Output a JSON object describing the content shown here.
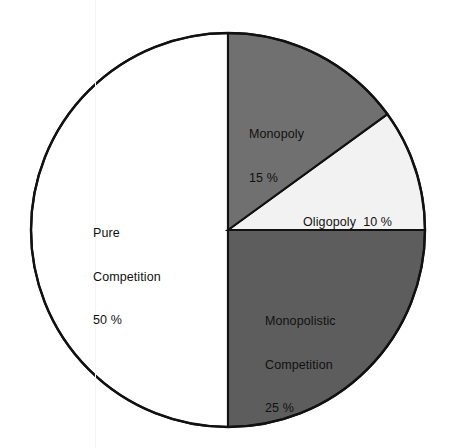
{
  "chart_data": {
    "type": "pie",
    "title": "",
    "subtitle": "",
    "xlabel": "",
    "ylabel": "",
    "legend": "none",
    "grid": false,
    "start_angle_deg": 0,
    "direction": "clockwise",
    "categories": [
      "Monopoly",
      "Oligopoly",
      "Monopolistic Competition",
      "Pure Competition"
    ],
    "values": [
      15,
      10,
      25,
      50
    ],
    "value_unit": "%",
    "slices": [
      {
        "name": "Monopoly",
        "label_lines": [
          "Monopoly",
          "15 %"
        ],
        "value": 15,
        "value_text": "15 %",
        "color": "#707070",
        "start_deg": 0,
        "end_deg": 54
      },
      {
        "name": "Oligopoly",
        "label_lines": [
          "Oligopoly  10 %"
        ],
        "value": 10,
        "value_text": "10 %",
        "color": "#f2f2f2",
        "start_deg": 54,
        "end_deg": 90
      },
      {
        "name": "Monopolistic Competition",
        "label_lines": [
          "Monopolistic",
          "Competition",
          "25 %"
        ],
        "value": 25,
        "value_text": "25 %",
        "color": "#5d5d5d",
        "start_deg": 90,
        "end_deg": 180
      },
      {
        "name": "Pure Competition",
        "label_lines": [
          "Pure",
          "Competition",
          "50 %"
        ],
        "value": 50,
        "value_text": "50 %",
        "color": "#ffffff",
        "start_deg": 180,
        "end_deg": 360
      }
    ],
    "geometry": {
      "center_x": 228,
      "center_y": 230,
      "radius": 197
    },
    "colors": {
      "outline": "#111111",
      "background": "#ffffff",
      "text": "#111111",
      "monopoly_fill": "#707070",
      "oligopoly_fill": "#f2f2f2",
      "monopolistic_fill": "#5d5d5d",
      "pure_fill": "#ffffff"
    }
  }
}
